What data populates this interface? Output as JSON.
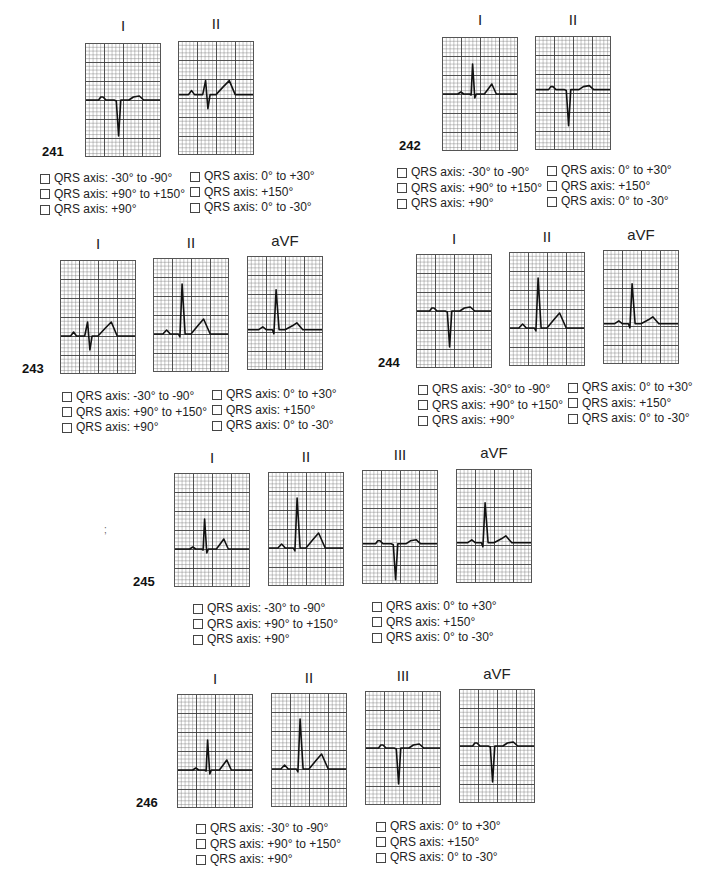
{
  "page": {
    "width": 713,
    "height": 890,
    "background": "#ffffff"
  },
  "option_labels": [
    "QRS axis: -30° to -90°",
    "QRS axis: +90° to +150°",
    "QRS axis: +90°",
    "QRS axis: 0° to +30°",
    "QRS axis: +150°",
    "QRS axis: 0° to -30°"
  ],
  "questions": [
    {
      "number": "241",
      "leads": [
        {
          "name": "I",
          "baseline": 0.5,
          "waveform": "negQRS"
        },
        {
          "name": "II",
          "baseline": 0.47,
          "waveform": "rsBigT"
        }
      ]
    },
    {
      "number": "242",
      "leads": [
        {
          "name": "I",
          "baseline": 0.5,
          "waveform": "posQRS"
        },
        {
          "name": "II",
          "baseline": 0.47,
          "waveform": "negQRS"
        }
      ]
    },
    {
      "number": "243",
      "leads": [
        {
          "name": "I",
          "baseline": 0.67,
          "waveform": "rsBigT"
        },
        {
          "name": "II",
          "baseline": 0.67,
          "waveform": "tallR"
        },
        {
          "name": "aVF",
          "baseline": 0.65,
          "waveform": "tallRsmallT"
        }
      ]
    },
    {
      "number": "244",
      "leads": [
        {
          "name": "I",
          "baseline": 0.5,
          "waveform": "negQRS"
        },
        {
          "name": "II",
          "baseline": 0.67,
          "waveform": "tallR"
        },
        {
          "name": "aVF",
          "baseline": 0.65,
          "waveform": "tallRsmallT"
        }
      ]
    },
    {
      "number": "245",
      "leads": [
        {
          "name": "I",
          "baseline": 0.67,
          "waveform": "posQRS"
        },
        {
          "name": "II",
          "baseline": 0.67,
          "waveform": "tallR"
        },
        {
          "name": "III",
          "baseline": 0.65,
          "waveform": "negQRS"
        },
        {
          "name": "aVF",
          "baseline": 0.65,
          "waveform": "tallRsmallT"
        }
      ]
    },
    {
      "number": "246",
      "leads": [
        {
          "name": "I",
          "baseline": 0.67,
          "waveform": "posQRS"
        },
        {
          "name": "II",
          "baseline": 0.67,
          "waveform": "tallR"
        },
        {
          "name": "III",
          "baseline": 0.5,
          "waveform": "negQRS"
        },
        {
          "name": "aVF",
          "baseline": 0.5,
          "waveform": "negQRS"
        }
      ]
    }
  ],
  "artifact_mark": ";",
  "colors": {
    "grid_major": "#3c3c3c",
    "grid_minor": "#8a8a8a",
    "trace": "#111111",
    "text": "#222222"
  }
}
